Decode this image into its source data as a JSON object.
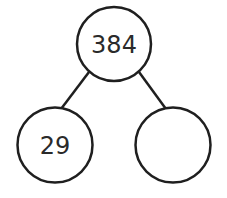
{
  "diagram": {
    "type": "number-bond",
    "stroke_color": "#1f1f1f",
    "whole": {
      "value": "384"
    },
    "parts": [
      {
        "value": "29"
      },
      {
        "value": ""
      }
    ]
  }
}
